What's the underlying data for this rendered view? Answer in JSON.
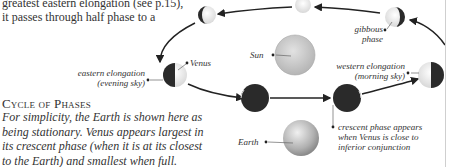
{
  "intro_text": {
    "lines": [
      "greatest eastern elongation (see p.15),",
      "it passes through half phase to a"
    ]
  },
  "section": {
    "heading": "Cycle of Phases",
    "caption_lines": [
      "For simplicity, the Earth is shown here as",
      "being stationary. Venus appears largest in",
      "its crescent phase (when it is at its closest",
      "to the Earth) and smallest when full."
    ]
  },
  "labels": {
    "venus": "Venus",
    "sun": "Sun",
    "earth": "Earth",
    "eastern_elongation": [
      "eastern elongation",
      "(evening sky)"
    ],
    "western_elongation": [
      "western elongation",
      "(morning sky)"
    ],
    "gibbous_phase": [
      "gibbous",
      "phase"
    ],
    "crescent_note": [
      "crescent phase appears",
      "when Venus is close to",
      "inferior conjunction"
    ]
  },
  "colors": {
    "dark_side": "#2a2a2a",
    "lit_side": "#f2f2f2",
    "sun": "#c8c8c8",
    "earth": "#bdbdbd",
    "arrow": "#222222",
    "text": "#333333"
  }
}
